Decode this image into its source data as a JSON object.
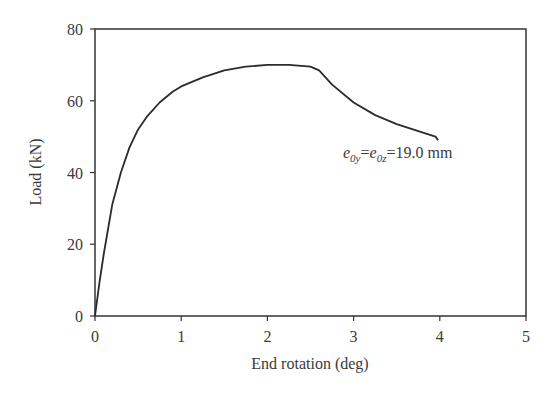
{
  "chart_data": {
    "type": "line",
    "title": "",
    "xlabel": "End rotation (deg)",
    "ylabel": "Load (kN)",
    "xlim": [
      0,
      5
    ],
    "ylim": [
      0,
      80
    ],
    "xticks": [
      0,
      1,
      2,
      3,
      4,
      5
    ],
    "yticks": [
      0,
      20,
      40,
      60,
      80
    ],
    "grid": false,
    "legend": null,
    "annotations": [
      {
        "text": "e0y=e0z=19.0 mm",
        "x": 2.9,
        "y": 47
      }
    ],
    "series": [
      {
        "name": "e0y=e0z=19.0 mm",
        "x": [
          0,
          0.05,
          0.1,
          0.2,
          0.3,
          0.4,
          0.5,
          0.6,
          0.75,
          0.9,
          1.0,
          1.25,
          1.5,
          1.75,
          2.0,
          2.25,
          2.5,
          2.6,
          2.75,
          3.0,
          3.25,
          3.5,
          3.75,
          3.95,
          3.98
        ],
        "values": [
          0,
          9,
          17,
          31,
          40,
          47,
          52,
          55.5,
          59.5,
          62.5,
          64,
          66.5,
          68.5,
          69.5,
          70,
          70,
          69.5,
          68.5,
          64.5,
          59.5,
          56,
          53.5,
          51.5,
          50,
          49
        ]
      }
    ]
  },
  "axes": {
    "x_label": "End rotation (deg)",
    "y_label": "Load (kN)",
    "x_ticks": [
      "0",
      "1",
      "2",
      "3",
      "4",
      "5"
    ],
    "y_ticks": [
      "0",
      "20",
      "40",
      "60",
      "80"
    ]
  },
  "annotation": {
    "e1": "e",
    "s1": "0y",
    "eq1": "=",
    "e2": "e",
    "s2": "0z",
    "rest": "=19.0 mm"
  },
  "colors": {
    "line": "#2b2b2b",
    "axis": "#333333",
    "text": "#3a3a3a"
  }
}
